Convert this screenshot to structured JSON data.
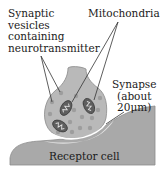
{
  "labels": {
    "vesicles": [
      "Synaptic",
      "vesicles",
      "containing",
      "neurotransmitter"
    ],
    "mitochondria": "Mitochondria",
    "synapse": [
      "Synapse",
      "(about",
      "20μm)"
    ],
    "receptor": "Receptor cell"
  },
  "colors": {
    "terminal_fill": "#b9b9b9",
    "terminal_stroke": "#8a8a8a",
    "vesicle_fill": "#9a9a9a",
    "mitochondrion_fill": "#6a6a6a",
    "receptor_fill": "#a9a9a9",
    "cleft_glow": "#e6e6e6",
    "line": "#333333"
  }
}
